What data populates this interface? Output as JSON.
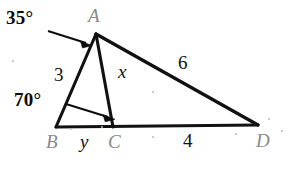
{
  "figure": {
    "type": "geometry-diagram",
    "background_color": "#ffffff",
    "stroke_color": "#111111",
    "vertex_label_color": "#8a8a8a",
    "measure_label_color": "#111111",
    "width": 296,
    "height": 169
  },
  "vertices": [
    {
      "id": "A",
      "label": "A",
      "x": 96,
      "y": 34,
      "label_x": 88,
      "label_y": 6
    },
    {
      "id": "B",
      "label": "B",
      "x": 56,
      "y": 127,
      "label_x": 46,
      "label_y": 132
    },
    {
      "id": "C",
      "label": "C",
      "x": 113,
      "y": 127,
      "label_x": 108,
      "label_y": 132
    },
    {
      "id": "D",
      "label": "D",
      "x": 258,
      "y": 125,
      "label_x": 256,
      "label_y": 131
    }
  ],
  "segments": [
    {
      "id": "AB",
      "from": "A",
      "to": "B",
      "measure": "3"
    },
    {
      "id": "AC",
      "from": "A",
      "to": "C",
      "measure": "x"
    },
    {
      "id": "AD",
      "from": "A",
      "to": "D",
      "measure": "6"
    },
    {
      "id": "BC",
      "from": "B",
      "to": "C",
      "measure": "y"
    },
    {
      "id": "CD",
      "from": "C",
      "to": "D",
      "measure": "4"
    }
  ],
  "measure_labels": [
    {
      "id": "side-ab",
      "text": "3",
      "style": "measure",
      "x": 54,
      "y": 65
    },
    {
      "id": "side-ac",
      "text": "x",
      "style": "var",
      "x": 118,
      "y": 62
    },
    {
      "id": "side-ad",
      "text": "6",
      "style": "measure",
      "x": 178,
      "y": 53
    },
    {
      "id": "side-bc",
      "text": "y",
      "style": "var",
      "x": 80,
      "y": 132
    },
    {
      "id": "side-cd",
      "text": "4",
      "style": "measure",
      "x": 183,
      "y": 131
    }
  ],
  "angles": [
    {
      "id": "angle-a",
      "text": "35°",
      "at_vertex": "A",
      "label_x": 6,
      "label_y": 8,
      "arrow": {
        "x1": 48,
        "y1": 31,
        "x2": 92,
        "y2": 45
      }
    },
    {
      "id": "angle-b",
      "text": "70°",
      "at_vertex": "B",
      "label_x": 14,
      "label_y": 90,
      "arrow": {
        "x1": 66,
        "y1": 104,
        "x2": 115,
        "y2": 119
      }
    }
  ],
  "specks": [
    {
      "x": 70,
      "y": 128,
      "r": 1.2
    },
    {
      "x": 152,
      "y": 136,
      "r": 1.1
    },
    {
      "x": 235,
      "y": 133,
      "r": 1.0
    },
    {
      "x": 268,
      "y": 118,
      "r": 1.2
    },
    {
      "x": 281,
      "y": 130,
      "r": 1.1
    },
    {
      "x": 101,
      "y": 126,
      "r": 1.0
    },
    {
      "x": 152,
      "y": 91,
      "r": 1.0
    },
    {
      "x": 12,
      "y": 60,
      "r": 1.0
    }
  ]
}
